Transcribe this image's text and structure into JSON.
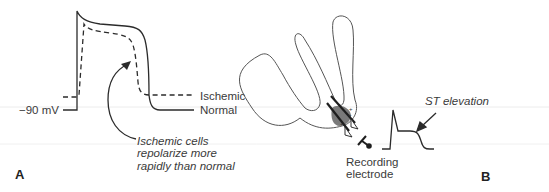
{
  "panel_a": {
    "label": "A",
    "voltage_label": "−90 mV",
    "curve_labels": {
      "ischemic": "Ischemic",
      "normal": "Normal"
    },
    "annotation": "Ischemic cells\nrepolarize more\nrapidly than normal",
    "curves": [
      {
        "name": "Normal",
        "style": "solid"
      },
      {
        "name": "Ischemic",
        "style": "dashed"
      }
    ]
  },
  "panel_b": {
    "label": "B",
    "electrode_label": "Recording\nelectrode",
    "ecg_annotation": "ST elevation"
  },
  "colors": {
    "line": "#2b2b2b",
    "outline": "#555555",
    "ischemic_zone": "#777777",
    "guide_line": "#e8e8e8"
  }
}
